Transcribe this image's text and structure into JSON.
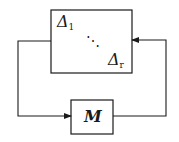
{
  "diagram": {
    "type": "feedback-loop",
    "uncertainty_block": {
      "first_label": "Δ",
      "first_sub": "1",
      "dots": "⋱",
      "last_label": "Δ",
      "last_sub": "r"
    },
    "plant_block": {
      "label": "M"
    },
    "colors": {
      "line": "#1a1a1a",
      "background": "#ffffff"
    }
  }
}
